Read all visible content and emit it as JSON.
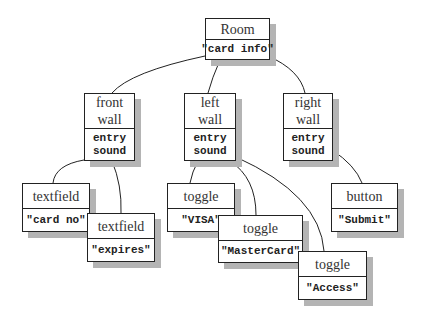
{
  "diagram": {
    "type": "tree",
    "nodes": {
      "room": {
        "title": "Room",
        "body": "\"card info\""
      },
      "front_wall": {
        "title_line1": "front",
        "title_line2": "wall",
        "body_line1": "entry",
        "body_line2": "sound"
      },
      "left_wall": {
        "title_line1": "left",
        "title_line2": "wall",
        "body_line1": "entry",
        "body_line2": "sound"
      },
      "right_wall": {
        "title_line1": "right",
        "title_line2": "wall",
        "body_line1": "entry",
        "body_line2": "sound"
      },
      "textfield_card_no": {
        "title": "textfield",
        "body": "\"card no\""
      },
      "textfield_expires": {
        "title": "textfield",
        "body": "\"expires\""
      },
      "toggle_visa": {
        "title": "toggle",
        "body": "\"VISA\""
      },
      "toggle_mastercard": {
        "title": "toggle",
        "body": "\"MasterCard\""
      },
      "toggle_access": {
        "title": "toggle",
        "body": "\"Access\""
      },
      "button_submit": {
        "title": "button",
        "body": "\"Submit\""
      }
    },
    "edges": [
      [
        "room",
        "front_wall"
      ],
      [
        "room",
        "left_wall"
      ],
      [
        "room",
        "right_wall"
      ],
      [
        "front_wall",
        "textfield_card_no"
      ],
      [
        "front_wall",
        "textfield_expires"
      ],
      [
        "left_wall",
        "toggle_visa"
      ],
      [
        "left_wall",
        "toggle_mastercard"
      ],
      [
        "left_wall",
        "toggle_access"
      ],
      [
        "right_wall",
        "button_submit"
      ]
    ]
  }
}
